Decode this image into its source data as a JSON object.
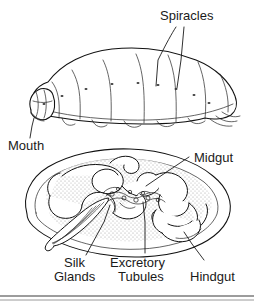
{
  "figure": {
    "title_text": "",
    "background_color": "#ffffff",
    "ink_color": "#1a1a1a",
    "stipple_color": "#8a8a8a",
    "label_font_size_px": 13
  },
  "labels": {
    "spiracles": "Spiracles",
    "mouth": "Mouth",
    "midgut": "Midgut",
    "silk_glands_line1": "Silk",
    "silk_glands_line2": "Glands",
    "excretory_tubules_line1": "Excretory",
    "excretory_tubules_line2": "Tubules",
    "hindgut": "Hindgut"
  },
  "panels": [
    {
      "name": "external-larva",
      "caption": "",
      "labels": [
        "Spiracles",
        "Mouth"
      ]
    },
    {
      "name": "internal-anatomy",
      "caption": "",
      "labels": [
        "Midgut",
        "Silk Glands",
        "Excretory Tubules",
        "Hindgut"
      ]
    }
  ],
  "footer": {
    "divider": ""
  }
}
